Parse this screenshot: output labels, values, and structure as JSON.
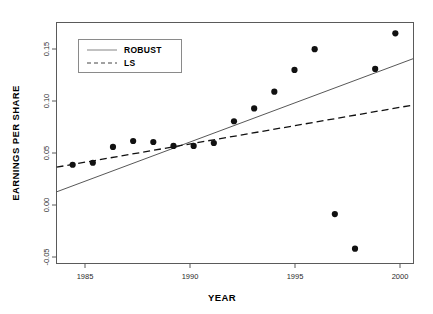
{
  "chart_data": {
    "type": "scatter",
    "title": "",
    "xlabel": "YEAR",
    "ylabel": "EARNINGS PER SHARE",
    "xlim": [
      1983.2,
      2000.9
    ],
    "ylim": [
      -0.062,
      0.182
    ],
    "xticks": [
      1985,
      1990,
      1995,
      2000
    ],
    "xtick_labels": [
      "1985",
      "1990",
      "1995",
      "2000"
    ],
    "yticks": [
      -0.05,
      0.0,
      0.05,
      0.1,
      0.15
    ],
    "ytick_labels": [
      "-0.05",
      "0.00",
      "0.05",
      "0.10",
      "0.15"
    ],
    "grid": false,
    "legend_position": "top-left",
    "x": [
      1984,
      1985,
      1986,
      1987,
      1988,
      1989,
      1990,
      1991,
      1992,
      1993,
      1994,
      1995,
      1996,
      1997,
      1998,
      1999,
      2000
    ],
    "values": [
      0.038,
      0.04,
      0.056,
      0.062,
      0.061,
      0.057,
      0.057,
      0.06,
      0.082,
      0.095,
      0.112,
      0.134,
      0.155,
      -0.012,
      -0.047,
      0.135,
      0.171
    ],
    "series": [
      {
        "name": "ROBUST",
        "type": "line",
        "style": "solid",
        "endpoints": [
          {
            "x": 1983.2,
            "y": 0.0105
          },
          {
            "x": 2000.9,
            "y": 0.1455
          }
        ]
      },
      {
        "name": "LS",
        "type": "line",
        "style": "dashed",
        "endpoints": [
          {
            "x": 1983.2,
            "y": 0.0355
          },
          {
            "x": 2000.9,
            "y": 0.0985
          }
        ]
      }
    ]
  },
  "legend": {
    "entries": [
      {
        "label": "ROBUST",
        "style": "solid"
      },
      {
        "label": "LS",
        "style": "dashed"
      }
    ]
  }
}
